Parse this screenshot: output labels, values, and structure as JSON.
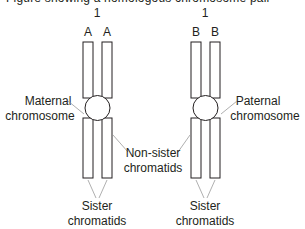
{
  "clipped_caption": "Figure showing a homologous chromosome pair",
  "chromosomes": [
    {
      "id": "maternal",
      "number_label": "1",
      "allele_labels": [
        "A",
        "A"
      ],
      "side_label": [
        "Maternal",
        "chromosome"
      ],
      "bottom_label": [
        "Sister",
        "chromatids"
      ]
    },
    {
      "id": "paternal",
      "number_label": "1",
      "allele_labels": [
        "B",
        "B"
      ],
      "side_label": [
        "Paternal",
        "chromosome"
      ],
      "bottom_label": [
        "Sister",
        "chromatids"
      ]
    }
  ],
  "center_label": [
    "Non-sister",
    "chromatids"
  ],
  "colors": {
    "stroke": "#231f20",
    "leader": "#9a9a9a",
    "fill": "#ffffff"
  }
}
